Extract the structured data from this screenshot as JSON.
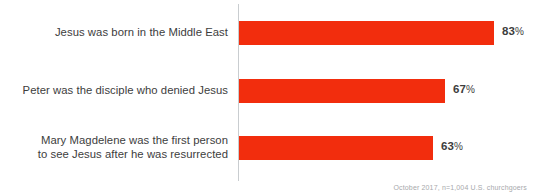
{
  "chart_data": {
    "type": "bar",
    "orientation": "horizontal",
    "title": "",
    "xlabel": "",
    "ylabel": "",
    "xlim": [
      0,
      100
    ],
    "grid": false,
    "legend": null,
    "value_suffix": "%",
    "categories": [
      "Jesus was born in the Middle East",
      "Peter was the disciple who denied Jesus",
      "Mary Magdelene was the first person\nto see Jesus after he was resurrected"
    ],
    "values": [
      83,
      67,
      63
    ],
    "bars": [
      {
        "label": "Jesus was born in the Middle East",
        "value": 83,
        "value_text": "83",
        "suffix": "%"
      },
      {
        "label": "Peter was the disciple who denied Jesus",
        "value": 67,
        "value_text": "67",
        "suffix": "%"
      },
      {
        "label": "Mary Magdelene was the first person\nto see Jesus after he was resurrected",
        "value": 63,
        "value_text": "63",
        "suffix": "%"
      }
    ],
    "bar_color": "#F22D0D",
    "label_color": "#3D3D3D",
    "axis_color": "#C9CDD0",
    "footnote_color": "#A7A9AC"
  },
  "footnote": "October 2017, n=1,004 U.S. churchgoers"
}
